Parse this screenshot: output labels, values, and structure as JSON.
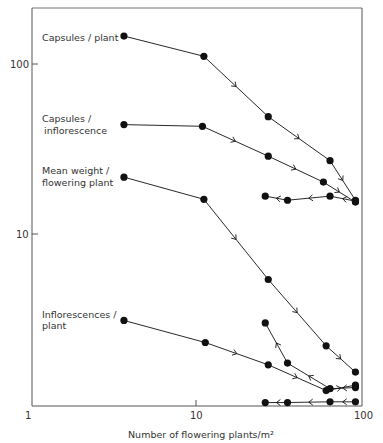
{
  "chart_data": {
    "type": "line",
    "title": "",
    "xlabel": "Number of flowering plants/m²",
    "ylabel": "",
    "xscale": "log",
    "yscale": "log",
    "xlim": [
      1,
      100
    ],
    "ylim": [
      1,
      200
    ],
    "x_ticks": [
      "1",
      "10",
      "100"
    ],
    "y_ticks": [
      "10",
      "100"
    ],
    "grid": false,
    "legend": "inline labels at left of each series",
    "series": [
      {
        "name": "Capsules / plant",
        "label_lines": [
          "Capsules / plant"
        ],
        "points": [
          [
            3.5,
            146
          ],
          [
            10.4,
            111
          ],
          [
            25,
            49
          ],
          [
            58,
            27
          ],
          [
            82,
            15.8
          ]
        ],
        "direction": "increasing density (arrows point right)"
      },
      {
        "name": "Capsules / inflorescence",
        "label_lines": [
          "Capsules /",
          "inflorescence"
        ],
        "points": [
          [
            3.5,
            44
          ],
          [
            10.2,
            43
          ],
          [
            25,
            28.7
          ],
          [
            53,
            20.2
          ],
          [
            82,
            15.4
          ]
        ],
        "direction": "increasing density (arrows point right)"
      },
      {
        "name": "Capsules / inflorescence (return path)",
        "label_lines": [],
        "points": [
          [
            82,
            15.6
          ],
          [
            58,
            16.7
          ],
          [
            32.5,
            15.8
          ],
          [
            24,
            16.7
          ]
        ],
        "direction": "decreasing density (arrows point left)"
      },
      {
        "name": "Mean weight / flowering plant",
        "label_lines": [
          "Mean weight /",
          "flowering plant"
        ],
        "points": [
          [
            3.5,
            21.6
          ],
          [
            10.4,
            16
          ],
          [
            25,
            5.4
          ],
          [
            55,
            2.2
          ],
          [
            82,
            1.54
          ]
        ],
        "direction": "increasing density (arrows point right)"
      },
      {
        "name": "Inflorescences / plant",
        "label_lines": [
          "Inflorescences /",
          "plant"
        ],
        "points": [
          [
            3.5,
            3.1
          ],
          [
            10.6,
            2.3
          ],
          [
            25,
            1.7
          ],
          [
            55,
            1.2
          ],
          [
            82,
            1.29
          ]
        ],
        "direction": "increasing density (arrows point right)"
      },
      {
        "name": "Inflorescences / plant (return path)",
        "label_lines": [],
        "points": [
          [
            82,
            1.25
          ],
          [
            58,
            1.23
          ],
          [
            32.5,
            1.74
          ],
          [
            24,
            3.0
          ]
        ],
        "direction": "decreasing density (arrows point left/up)"
      },
      {
        "name": "Inflorescences / plant (bottom return path)",
        "label_lines": [],
        "points": [
          [
            82,
            1.03
          ],
          [
            58,
            1.03
          ],
          [
            32.5,
            1.02
          ],
          [
            24,
            1.02
          ]
        ],
        "direction": "decreasing density (arrows point left)"
      }
    ]
  },
  "header_text": "",
  "axes": {
    "x_tick_labels": [
      "1",
      "10",
      "100"
    ],
    "y_tick_labels": [
      "10",
      "100"
    ],
    "x_title": "Number of flowering plants/m²"
  },
  "labels": {
    "capsules_plant": "Capsules / plant",
    "capsules_infl_1": "Capsules /",
    "capsules_infl_2": "inflorescence",
    "mean_weight_1": "Mean weight /",
    "mean_weight_2": "flowering plant",
    "infl_plant_1": "Inflorescences /",
    "infl_plant_2": "plant"
  },
  "colors": {
    "ink": "#111111",
    "frame": "#555555",
    "text": "#333333"
  }
}
